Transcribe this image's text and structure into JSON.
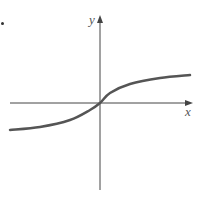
{
  "chart_data": {
    "type": "line",
    "title": "",
    "xlabel": "x",
    "ylabel": "y",
    "grid": false,
    "legend": null,
    "series": [
      {
        "name": "curve",
        "points_px": [
          [
            10,
            130
          ],
          [
            40,
            127
          ],
          [
            70,
            120
          ],
          [
            90,
            110
          ],
          [
            100,
            103
          ],
          [
            110,
            93
          ],
          [
            130,
            84
          ],
          [
            160,
            78
          ],
          [
            190,
            75
          ]
        ]
      }
    ]
  },
  "axes": {
    "x_label": "x",
    "y_label": "y"
  },
  "marker": "•",
  "colors": {
    "axis": "#444444",
    "curve": "#555555"
  }
}
